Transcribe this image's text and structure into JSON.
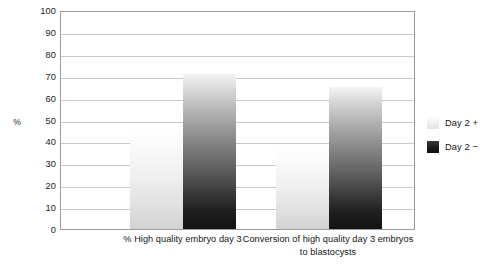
{
  "chart_data": {
    "type": "bar",
    "title": "",
    "xlabel": "",
    "ylabel": "%",
    "ylim": [
      0,
      100
    ],
    "ytick_step": 10,
    "yticks": [
      100,
      90,
      80,
      70,
      60,
      50,
      40,
      30,
      20,
      10,
      0
    ],
    "grid": true,
    "legend_position": "right",
    "categories": [
      "% High quality embryo day 3",
      "Conversion of high quality day 3 embryos to blastocysts"
    ],
    "category_lines": [
      [
        "% High quality embryo day 3"
      ],
      [
        "Conversion of high quality day 3 embryos",
        "to blastocysts"
      ]
    ],
    "series": [
      {
        "name": "Day 2 +",
        "values": [
          48,
          39
        ],
        "color": "#e8e8e8"
      },
      {
        "name": "Day 2 −",
        "values": [
          71,
          65
        ],
        "color": "#1a1a1a"
      }
    ]
  },
  "legend": {
    "items": [
      {
        "label": "Day 2 +",
        "swatch": "light"
      },
      {
        "label": "Day 2 −",
        "swatch": "dark"
      }
    ]
  },
  "colors": {
    "plot_border": "#9b9b9b",
    "gridline": "#c9c9c9",
    "background": "#ffffff",
    "text": "#1a1a1a"
  }
}
